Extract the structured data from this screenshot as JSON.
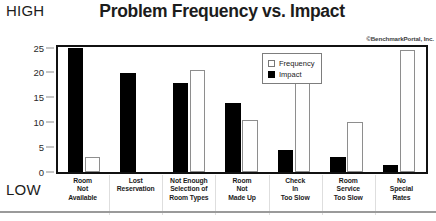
{
  "chart_data": {
    "type": "bar",
    "title": "Problem Frequency vs. Impact",
    "xlabel": "",
    "ylabel": "",
    "ylim": [
      0,
      25
    ],
    "yticks": [
      0,
      5,
      10,
      15,
      20,
      25
    ],
    "grid": false,
    "legend_position": "top-right-inside",
    "axis_high_label": "HIGH",
    "axis_low_label": "LOW",
    "annotation": "©BenchmarkPortal, Inc.",
    "categories": [
      "Room Not Available",
      "Lost Reservation",
      "Not Enough Selection of Room Types",
      "Room Not Made Up",
      "Check In Too Slow",
      "Room Service Too Slow",
      "No Special Rates"
    ],
    "category_lines": [
      [
        "Room",
        "Not",
        "Available"
      ],
      [
        "Lost",
        "Reservation"
      ],
      [
        "Not Enough",
        "Selection of",
        "Room Types"
      ],
      [
        "Room",
        "Not",
        "Made Up"
      ],
      [
        "Check",
        "In",
        "Too Slow"
      ],
      [
        "Room",
        "Service",
        "Too Slow"
      ],
      [
        "No",
        "Special",
        "Rates"
      ]
    ],
    "series": [
      {
        "name": "Impact",
        "color": "#000000",
        "values": [
          25,
          20,
          18,
          14,
          4.5,
          3,
          1.5
        ]
      },
      {
        "name": "Frequency",
        "color": "#ffffff",
        "values": [
          3,
          0,
          20.5,
          10.5,
          18,
          10,
          24.5
        ]
      }
    ]
  },
  "legend": {
    "items": [
      {
        "label": "Frequency",
        "swatch": "frequency-swatch"
      },
      {
        "label": "Impact",
        "swatch": "impact-swatch"
      }
    ]
  },
  "yaxis": {
    "ticks": [
      "25",
      "20",
      "15",
      "10",
      "5",
      "0"
    ]
  }
}
